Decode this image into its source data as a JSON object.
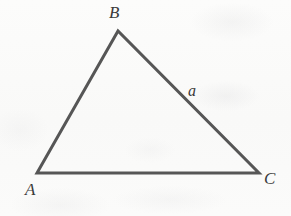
{
  "figure": {
    "type": "geometry-diagram",
    "shape": "triangle",
    "background_color": "#fbfbfa",
    "stroke_color": "#565656",
    "stroke_width": 3,
    "label_color": "#3a3a3a",
    "canvas": {
      "width": 291,
      "height": 216
    },
    "vertices": [
      {
        "name": "A",
        "label": "A",
        "x": 37,
        "y": 173
      },
      {
        "name": "B",
        "label": "B",
        "x": 118,
        "y": 31
      },
      {
        "name": "C",
        "label": "C",
        "x": 259,
        "y": 173
      }
    ],
    "edges": [
      {
        "name": "AB",
        "from": "A",
        "to": "B",
        "label": ""
      },
      {
        "name": "BC",
        "from": "B",
        "to": "C",
        "label": "a"
      },
      {
        "name": "CA",
        "from": "C",
        "to": "A",
        "label": ""
      }
    ],
    "labels": {
      "vertex_a": "A",
      "vertex_b": "B",
      "vertex_c": "C",
      "side_a": "a"
    }
  }
}
